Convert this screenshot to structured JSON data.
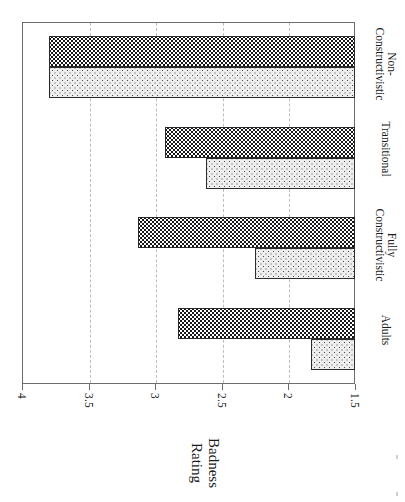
{
  "figure": {
    "orientation": "rotated-90-horizontal-bar-chart",
    "background_color": "#ffffff",
    "frame_color": "#6d6d6d",
    "gridline_color": "#bdbdbd"
  },
  "axis_title": {
    "line1": "Badness",
    "line2": "Rating"
  },
  "categories": [
    {
      "line1": "Non-",
      "line2": "Constructivistic"
    },
    {
      "line1": "Transitional",
      "line2": ""
    },
    {
      "line1": "Fully",
      "line2": "Constructivistic"
    },
    {
      "line1": "Adults",
      "line2": ""
    }
  ],
  "tick_labels": [
    "4",
    "3.5",
    "3",
    "2.5",
    "2",
    "1.5"
  ],
  "series_colors": {
    "dark": "#17171a",
    "light": "#eeeeee"
  },
  "chart_data": {
    "type": "bar",
    "orientation": "horizontal",
    "title": "",
    "xlabel": "Badness Rating",
    "ylabel": "",
    "categories": [
      "Non-Constructivistic",
      "Transitional",
      "Fully Constructivistic",
      "Adults"
    ],
    "tick_labels": [
      "4",
      "3.5",
      "3",
      "2.5",
      "2",
      "1.5"
    ],
    "ticks": [
      4,
      3.5,
      3,
      2.5,
      2,
      1.5
    ],
    "xlim": [
      4,
      1.5
    ],
    "axis_reversed": true,
    "grid": true,
    "gridlines_at": [
      3.5,
      3,
      2.5,
      2
    ],
    "legend": "none",
    "series": [
      {
        "name": "dark",
        "values": [
          3.8,
          2.93,
          3.13,
          2.83
        ]
      },
      {
        "name": "light",
        "values": [
          3.8,
          2.62,
          2.25,
          1.83
        ]
      }
    ]
  }
}
